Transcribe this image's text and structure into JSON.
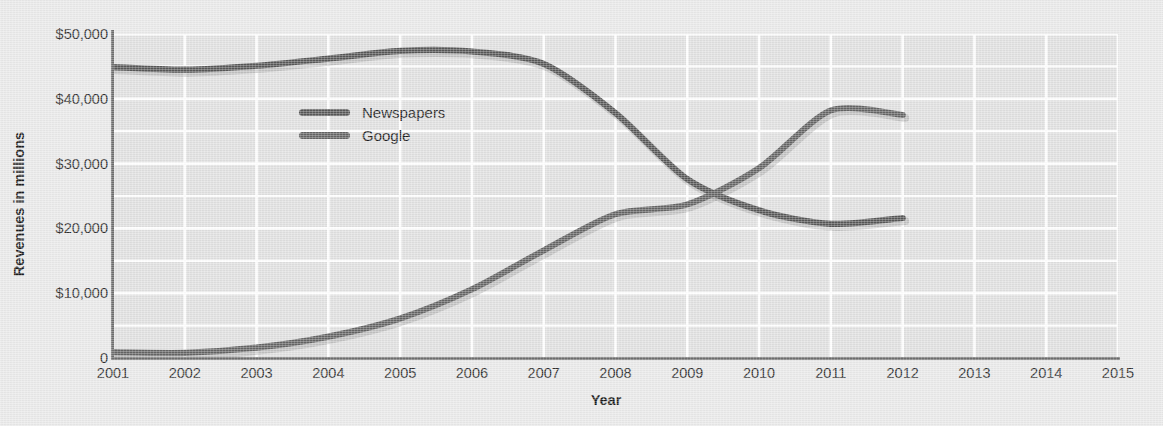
{
  "chart_data": {
    "type": "line",
    "title": "",
    "xlabel": "Year",
    "ylabel": "Revenues in millions",
    "x": [
      2001,
      2002,
      2003,
      2004,
      2005,
      2006,
      2007,
      2008,
      2009,
      2010,
      2011,
      2012
    ],
    "xlim": [
      2001,
      2015
    ],
    "ylim": [
      0,
      50000
    ],
    "x_ticks": [
      "2001",
      "2002",
      "2003",
      "2004",
      "2005",
      "2006",
      "2007",
      "2008",
      "2009",
      "2010",
      "2011",
      "2012",
      "2013",
      "2014",
      "2015"
    ],
    "y_ticks": [
      "0",
      "$10,000",
      "$20,000",
      "$30,000",
      "$40,000",
      "$50,000"
    ],
    "y_tick_values": [
      0,
      10000,
      20000,
      30000,
      40000,
      50000
    ],
    "y_minor_gridline_values": [
      5000,
      15000,
      25000,
      35000,
      45000
    ],
    "grid": true,
    "grid_color": "#ffffff",
    "plot_background": "#e0e0e0",
    "figure_background": "#e9e9e9",
    "legend_position": "inside-upper-left",
    "series": [
      {
        "name": "Newspapers",
        "color": "#575757",
        "values": [
          44900,
          44500,
          45100,
          46200,
          47400,
          47300,
          45400,
          37800,
          27600,
          22800,
          20700,
          21600
        ]
      },
      {
        "name": "Google",
        "color": "#646464",
        "values": [
          900,
          800,
          1600,
          3300,
          6100,
          10600,
          16600,
          22200,
          23700,
          29300,
          38200,
          37500
        ]
      }
    ]
  },
  "legend": {
    "items": [
      {
        "label": "Newspapers",
        "color": "#575757"
      },
      {
        "label": "Google",
        "color": "#646464"
      }
    ]
  },
  "axes": {
    "x_title": "Year",
    "y_title": "Revenues in millions"
  }
}
